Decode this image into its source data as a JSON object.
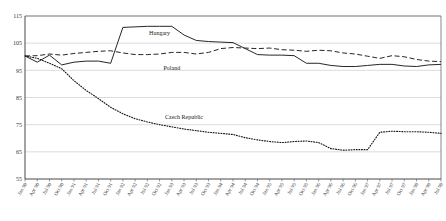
{
  "chart_data": {
    "type": "line",
    "title": "",
    "xlabel": "",
    "ylabel": "",
    "ylim": [
      55,
      115
    ],
    "yticks": [
      115,
      105,
      95,
      85,
      75,
      65,
      55
    ],
    "ytick_labels": [
      "115",
      "105",
      "95",
      "85",
      "75",
      "65",
      "55"
    ],
    "grid": true,
    "legend": "inline-annotations",
    "x": [
      "Jan 90",
      "Apr 90",
      "Jul 90",
      "Oct 90",
      "Jan 91",
      "Apr 91",
      "Jul 91",
      "Oct 91",
      "Jan 92",
      "Apr 92",
      "Jul 92",
      "Oct 92",
      "Jan 93",
      "Apr 93",
      "Jul 93",
      "Oct 93",
      "Jan 94",
      "Apr 94",
      "Jul 94",
      "Oct 94",
      "Jan 95",
      "Apr 95",
      "Jul 95",
      "Oct 95",
      "Jan 96",
      "Apr 96",
      "Jul 96",
      "Oct 96",
      "Jan 97",
      "Apr 97",
      "Jul 97",
      "Oct 97",
      "Jan 98",
      "Apr 98",
      "Jul 98"
    ],
    "series": [
      {
        "name": "Hungary",
        "style": "solid",
        "label_x": "Oct 92",
        "label_value": 108,
        "values": [
          100.3,
          98.0,
          100.6,
          97.0,
          98.0,
          98.4,
          98.4,
          97.6,
          110.8,
          111.0,
          111.2,
          111.2,
          111.2,
          108.0,
          106.0,
          105.6,
          105.4,
          105.2,
          103.0,
          100.8,
          100.6,
          100.6,
          100.4,
          97.6,
          97.6,
          96.8,
          96.4,
          96.4,
          96.8,
          97.2,
          97.2,
          96.6,
          96.4,
          97.0,
          97.2
        ]
      },
      {
        "name": "Poland",
        "style": "dashed",
        "label_x": "Jan 93",
        "label_value": 95,
        "values": [
          100.3,
          100.4,
          101.0,
          100.6,
          101.2,
          101.6,
          102.0,
          102.2,
          101.4,
          100.8,
          100.8,
          101.0,
          101.6,
          101.6,
          101.0,
          101.6,
          103.0,
          103.4,
          103.2,
          103.0,
          103.2,
          102.6,
          102.4,
          102.0,
          102.4,
          102.2,
          101.4,
          101.0,
          100.2,
          99.4,
          100.4,
          100.0,
          99.0,
          98.4,
          98.2
        ]
      },
      {
        "name": "Czech Republic",
        "style": "dotted",
        "label_x": "Apr 93",
        "label_value": 77,
        "values": [
          100.3,
          99.4,
          97.6,
          95.6,
          91.2,
          87.6,
          84.6,
          81.4,
          79.0,
          77.2,
          76.0,
          75.0,
          74.2,
          73.4,
          72.8,
          72.2,
          71.8,
          71.4,
          70.2,
          69.4,
          68.8,
          68.4,
          68.8,
          69.0,
          68.4,
          66.2,
          65.6,
          65.8,
          65.8,
          72.2,
          72.6,
          72.4,
          72.4,
          72.2,
          71.8
        ]
      }
    ]
  }
}
